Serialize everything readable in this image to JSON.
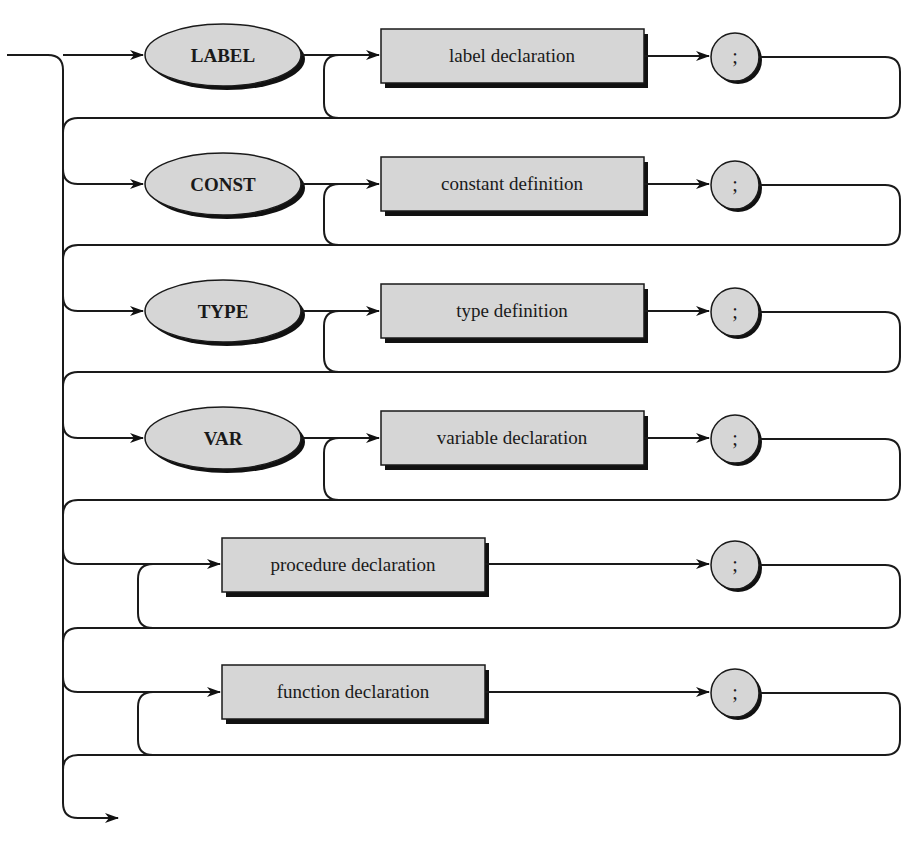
{
  "diagram": {
    "type": "syntax-diagram",
    "rows": [
      {
        "keyword": "LABEL",
        "element": "label declaration",
        "terminator": ";"
      },
      {
        "keyword": "CONST",
        "element": "constant definition",
        "terminator": ";"
      },
      {
        "keyword": "TYPE",
        "element": "type definition",
        "terminator": ";"
      },
      {
        "keyword": "VAR",
        "element": "variable declaration",
        "terminator": ";"
      },
      {
        "keyword": null,
        "element": "procedure declaration",
        "terminator": ";"
      },
      {
        "keyword": null,
        "element": "function declaration",
        "terminator": ";"
      }
    ],
    "colors": {
      "fill": "#d6d6d6",
      "stroke": "#1a1a1a",
      "shadow": "#111111",
      "background": "#ffffff"
    }
  }
}
